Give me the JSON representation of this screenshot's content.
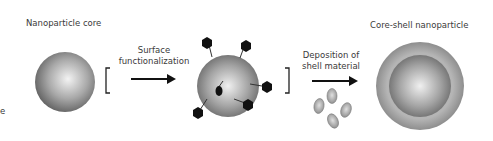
{
  "labels": {
    "core": "Nanoparticle core",
    "step1": [
      "Surface",
      "functionalization"
    ],
    "step2": [
      "Deposition of",
      "shell material"
    ],
    "result": "Core-shell nanoparticle",
    "edge_char": "e"
  },
  "colors": {
    "sphere_light": "#f2f2f2",
    "sphere_mid": "#a0a0a0",
    "sphere_dark": "#5a5a5a",
    "shell": "#9a9a9a",
    "ligand": "#111111",
    "arrow": "#111111"
  }
}
